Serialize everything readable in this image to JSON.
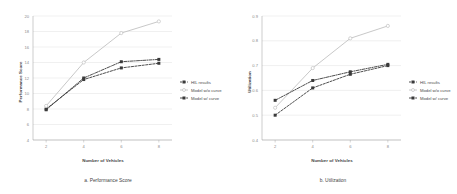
{
  "figure": {
    "background_color": "#ffffff",
    "panel_count": 2
  },
  "colors": {
    "hil_results": "#3a3a3a",
    "model_wo_curve": "#c2c2c2",
    "model_w_curve": "#3a3a3a",
    "grid": "#d8d8d8",
    "axis": "#9a9a9a",
    "text": "#3f3f3f",
    "tick_text": "#8a8a8a"
  },
  "legend": {
    "position": "right",
    "entries": [
      {
        "label": "HIL results",
        "color": "#3a3a3a",
        "marker": "square",
        "dash": "dashed"
      },
      {
        "label": "Model w/o curve",
        "color": "#c2c2c2",
        "marker": "circle-open",
        "dash": "solid"
      },
      {
        "label": "Model w/ curve",
        "color": "#3a3a3a",
        "marker": "square",
        "dash": "dashdot"
      }
    ]
  },
  "chart_data": [
    {
      "type": "line",
      "id": "performance-score",
      "title": "",
      "caption": "a. Performance Score",
      "xlabel": "Number of Vehicles",
      "ylabel": "Performance Score",
      "x": [
        2,
        4,
        6,
        8
      ],
      "xticklabels": [
        "2",
        "4",
        "6",
        "8"
      ],
      "xlim": [
        1.3,
        8.7
      ],
      "ylim": [
        4,
        20
      ],
      "yticks": [
        4,
        6,
        8,
        10,
        12,
        14,
        16,
        18,
        20
      ],
      "yticklabels": [
        "4",
        "6",
        "8",
        "10",
        "12",
        "14",
        "16",
        "18",
        "20"
      ],
      "grid": true,
      "legend_position": "right",
      "series": [
        {
          "name": "HIL results",
          "values": [
            8.0,
            11.8,
            13.3,
            13.9
          ],
          "color": "#3a3a3a",
          "marker": "square",
          "dash": "dashed"
        },
        {
          "name": "Model w/o curve",
          "values": [
            8.4,
            14.0,
            17.8,
            19.3
          ],
          "color": "#c2c2c2",
          "marker": "circle-open",
          "dash": "solid"
        },
        {
          "name": "Model w/ curve",
          "values": [
            7.9,
            12.0,
            14.1,
            14.4
          ],
          "color": "#3a3a3a",
          "marker": "square",
          "dash": "dashdot"
        }
      ]
    },
    {
      "type": "line",
      "id": "utilization",
      "title": "",
      "caption": "b. Utilization",
      "xlabel": "Number of Vehicles",
      "ylabel": "Utilization",
      "x": [
        2,
        4,
        6,
        8
      ],
      "xticklabels": [
        "2",
        "4",
        "6",
        "8"
      ],
      "xlim": [
        1.3,
        8.7
      ],
      "ylim": [
        0.4,
        0.9
      ],
      "yticks": [
        0.4,
        0.5,
        0.6,
        0.7,
        0.8,
        0.9
      ],
      "yticklabels": [
        "0.4",
        "0.5",
        "0.6",
        "0.7",
        "0.8",
        "0.9"
      ],
      "grid": true,
      "legend_position": "right",
      "series": [
        {
          "name": "HIL results",
          "values": [
            0.5,
            0.61,
            0.665,
            0.7
          ],
          "color": "#3a3a3a",
          "marker": "square",
          "dash": "dashed"
        },
        {
          "name": "Model w/o curve",
          "values": [
            0.53,
            0.69,
            0.81,
            0.86
          ],
          "color": "#c2c2c2",
          "marker": "circle-open",
          "dash": "solid"
        },
        {
          "name": "Model w/ curve",
          "values": [
            0.56,
            0.64,
            0.675,
            0.705
          ],
          "color": "#3a3a3a",
          "marker": "square",
          "dash": "dashdot"
        }
      ]
    }
  ]
}
